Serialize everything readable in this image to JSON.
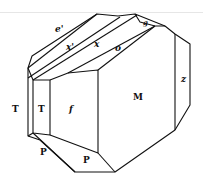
{
  "figure": {
    "type": "crystal-morphology-drawing",
    "stroke_color": "#111111",
    "background": "#ffffff",
    "faces": [
      {
        "id": "e-prime",
        "label": "e'",
        "style": "italic"
      },
      {
        "id": "x-prime",
        "label": "x'",
        "style": "italic"
      },
      {
        "id": "x",
        "label": "x",
        "style": "italic"
      },
      {
        "id": "o",
        "label": "o",
        "style": "italic"
      },
      {
        "id": "g",
        "label": "g",
        "style": "italic"
      },
      {
        "id": "z",
        "label": "z",
        "style": "italic"
      },
      {
        "id": "T-outer",
        "label": "T",
        "style": "upright"
      },
      {
        "id": "T-inner",
        "label": "T",
        "style": "upright"
      },
      {
        "id": "f",
        "label": "f",
        "style": "italic"
      },
      {
        "id": "M",
        "label": "M",
        "style": "upright"
      },
      {
        "id": "P-left",
        "label": "P",
        "style": "upright"
      },
      {
        "id": "P-right",
        "label": "P",
        "style": "upright"
      }
    ]
  }
}
